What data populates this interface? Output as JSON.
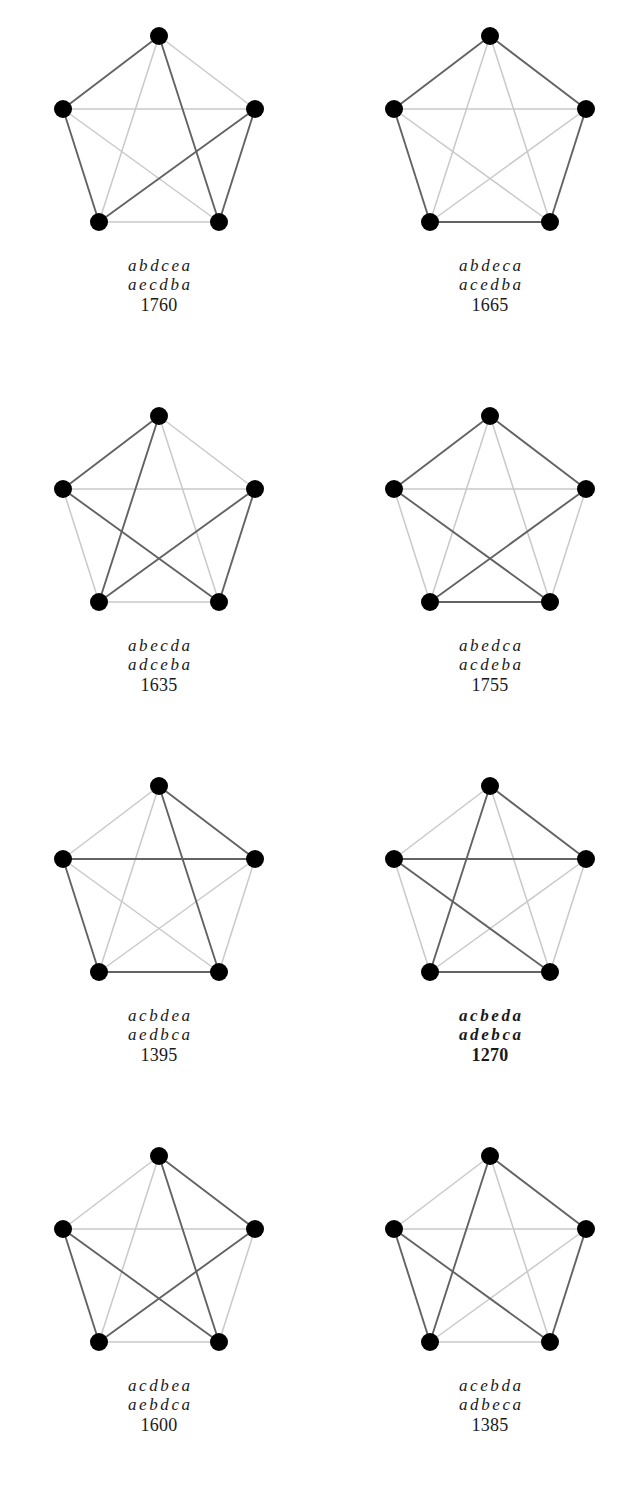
{
  "figure": {
    "type": "graph-tour-grid",
    "columns": 2,
    "rows": 4,
    "vertex_count": 5,
    "vertex_labels": [
      "a",
      "b",
      "c",
      "d",
      "e"
    ],
    "vertex_positions": {
      "a": [
        118,
        22
      ],
      "b": [
        22,
        95
      ],
      "c": [
        214,
        95
      ],
      "d": [
        58,
        208
      ],
      "e": [
        178,
        208
      ]
    },
    "node_radius": 9,
    "node_color": "#000000",
    "edge_color_tour": "#636363",
    "edge_color_other": "#c9c9c9",
    "optimal_cost": 1270,
    "panels": [
      {
        "id": "panel-1",
        "tour": "abdcea",
        "reverse_tour": "aecdba",
        "cost": "1760",
        "tour_edges": [
          "ab",
          "bd",
          "dc",
          "ce",
          "ea"
        ],
        "optimal": false
      },
      {
        "id": "panel-2",
        "tour": "abdeca",
        "reverse_tour": "acedba",
        "cost": "1665",
        "tour_edges": [
          "ab",
          "bd",
          "de",
          "ec",
          "ca"
        ],
        "optimal": false
      },
      {
        "id": "panel-3",
        "tour": "abecda",
        "reverse_tour": "adceba",
        "cost": "1635",
        "tour_edges": [
          "ab",
          "be",
          "ec",
          "cd",
          "da"
        ],
        "optimal": false
      },
      {
        "id": "panel-4",
        "tour": "abedca",
        "reverse_tour": "acdeba",
        "cost": "1755",
        "tour_edges": [
          "ab",
          "be",
          "ed",
          "dc",
          "ca"
        ],
        "optimal": false
      },
      {
        "id": "panel-5",
        "tour": "acbdea",
        "reverse_tour": "aedbca",
        "cost": "1395",
        "tour_edges": [
          "ac",
          "cb",
          "bd",
          "de",
          "ea"
        ],
        "optimal": false
      },
      {
        "id": "panel-6",
        "tour": "acbeda",
        "reverse_tour": "adebca",
        "cost": "1270",
        "tour_edges": [
          "ac",
          "cb",
          "be",
          "ed",
          "da"
        ],
        "optimal": true
      },
      {
        "id": "panel-7",
        "tour": "acdbea",
        "reverse_tour": "aebdca",
        "cost": "1600",
        "tour_edges": [
          "ac",
          "cd",
          "db",
          "be",
          "ea"
        ],
        "optimal": false
      },
      {
        "id": "panel-8",
        "tour": "acebda",
        "reverse_tour": "adbeca",
        "cost": "1385",
        "tour_edges": [
          "ac",
          "ce",
          "eb",
          "bd",
          "da"
        ],
        "optimal": false
      }
    ]
  }
}
